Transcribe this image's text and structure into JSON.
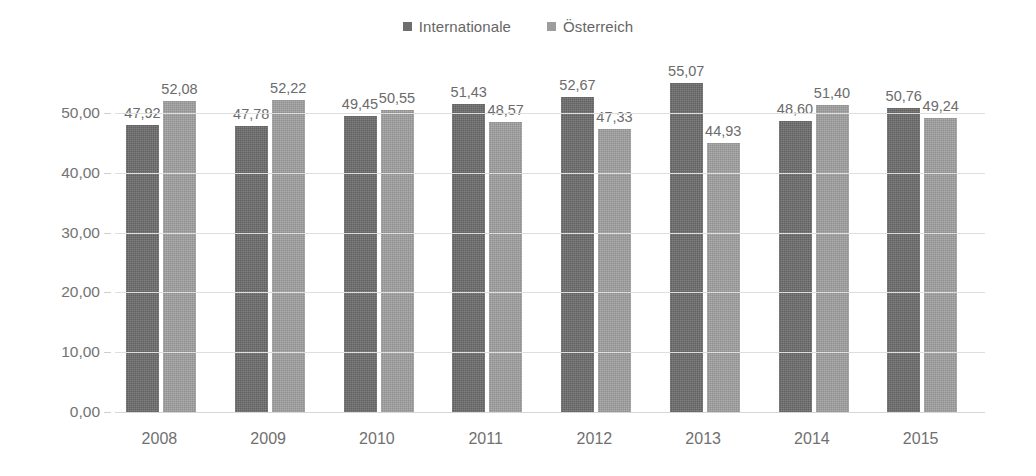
{
  "legend": {
    "position": "top-center",
    "items": [
      {
        "label": "Internationale",
        "color": "#6e6e6e",
        "marker": "square-marker-icon"
      },
      {
        "label": "Österreich",
        "color": "#9d9d9d",
        "marker": "square-marker-icon"
      }
    ]
  },
  "axis": {
    "y_ticks": [
      "0,00",
      "10,00",
      "20,00",
      "30,00",
      "40,00",
      "50,00"
    ],
    "x_ticks": [
      "2008",
      "2009",
      "2010",
      "2011",
      "2012",
      "2013",
      "2014",
      "2015"
    ]
  },
  "labels": {
    "internationale": [
      "47,92",
      "47,78",
      "49,45",
      "51,43",
      "52,67",
      "55,07",
      "48,60",
      "50,76"
    ],
    "oesterreich": [
      "52,08",
      "52,22",
      "50,55",
      "48,57",
      "47,33",
      "44,93",
      "51,40",
      "49,24"
    ]
  },
  "chart_data": {
    "type": "bar",
    "title": "",
    "subtitle": "",
    "xlabel": "",
    "ylabel": "",
    "categories": [
      "2008",
      "2009",
      "2010",
      "2011",
      "2012",
      "2013",
      "2014",
      "2015"
    ],
    "series": [
      {
        "name": "Internationale",
        "color": "#6e6e6e",
        "values": [
          47.92,
          47.78,
          49.45,
          51.43,
          52.67,
          55.07,
          48.6,
          50.76
        ],
        "value_labels": [
          "47,92",
          "47,78",
          "49,45",
          "51,43",
          "52,67",
          "55,07",
          "48,60",
          "50,76"
        ]
      },
      {
        "name": "Österreich",
        "color": "#9d9d9d",
        "values": [
          52.08,
          52.22,
          50.55,
          48.57,
          47.33,
          44.93,
          51.4,
          49.24
        ],
        "value_labels": [
          "52,08",
          "52,22",
          "50,55",
          "48,57",
          "47,33",
          "44,93",
          "51,40",
          "49,24"
        ]
      }
    ],
    "ylim": [
      0,
      50
    ],
    "ytick_values": [
      0,
      10,
      20,
      30,
      40,
      50
    ],
    "ytick_labels": [
      "0,00",
      "10,00",
      "20,00",
      "30,00",
      "40,00",
      "50,00"
    ],
    "grid": true,
    "grid_axis": "y",
    "legend_position": "top-center",
    "decimal_separator": ","
  }
}
